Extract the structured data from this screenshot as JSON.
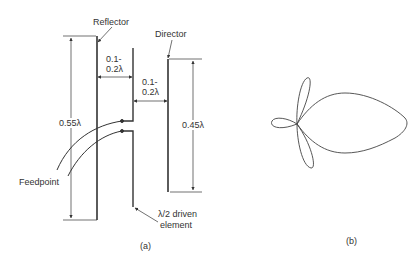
{
  "figure_a": {
    "caption": "(a)",
    "labels": {
      "reflector": "Reflector",
      "director": "Director",
      "spacing_1_line1": "0.1-",
      "spacing_1_line2": "0.2λ",
      "spacing_2_line1": "0.1-",
      "spacing_2_line2": "0.2λ",
      "reflector_length": "0.55λ",
      "director_length": "0.45λ",
      "feedpoint": "Feedpoint",
      "driven_line1": "λ/2 driven",
      "driven_line2": "element"
    }
  },
  "figure_b": {
    "caption": "(b)",
    "description": "Radiation pattern: main forward lobe, small back lobe, two side lobes"
  },
  "colors": {
    "line": "#333333",
    "text": "#333333",
    "background": "#ffffff"
  }
}
